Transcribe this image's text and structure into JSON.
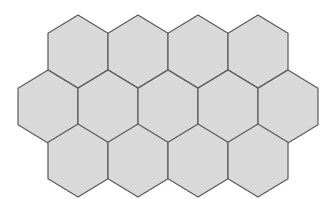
{
  "diagram": {
    "type": "hexagon-grid",
    "orientation": "pointy-top",
    "colors": {
      "fill": "#d9d9d9",
      "stroke": "#5a5a5a",
      "background": "#ffffff"
    },
    "hex": {
      "half_width": 30,
      "half_height": 36.5,
      "shoulder": 18.25
    },
    "rows": [
      {
        "cy": 51.5,
        "centers_x": [
          78,
          138,
          198,
          258
        ]
      },
      {
        "cy": 106.5,
        "centers_x": [
          48,
          108,
          168,
          228,
          288
        ]
      },
      {
        "cy": 160.5,
        "centers_x": [
          78,
          138,
          198,
          258
        ]
      }
    ]
  }
}
